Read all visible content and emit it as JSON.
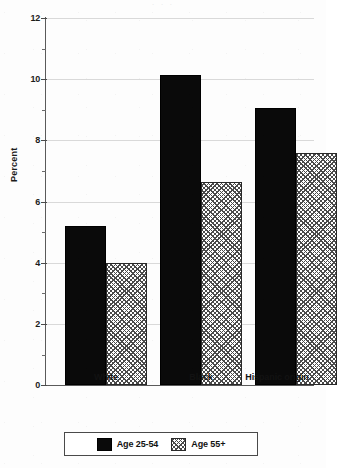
{
  "chart_data": {
    "type": "bar",
    "title": "",
    "subtitle": "",
    "xlabel": "",
    "ylabel": "Percent",
    "ylim": [
      0,
      12
    ],
    "ytick_labels": [
      "0",
      "2",
      "4",
      "6",
      "8",
      "10",
      "12"
    ],
    "ytick_values": [
      0,
      2,
      4,
      6,
      8,
      10,
      12
    ],
    "yminor_values": [
      1,
      3,
      5,
      7,
      9,
      11
    ],
    "grid": true,
    "grid_axis": "y",
    "legend_position": "bottom",
    "categories": [
      "White",
      "Black",
      "Hispanic origin"
    ],
    "series": [
      {
        "name": "Age 25-54",
        "pattern": "solid-black",
        "color": "#0a0a0a",
        "values": [
          5.2,
          10.15,
          9.05
        ]
      },
      {
        "name": "Age 55+",
        "pattern": "cross-hatch",
        "color": "#ffffff",
        "values": [
          4.0,
          6.65,
          7.6
        ]
      }
    ]
  },
  "axes": {
    "y_label": "Percent",
    "ticks": [
      {
        "label": "12",
        "value": 12
      },
      {
        "label": "10",
        "value": 10
      },
      {
        "label": "8",
        "value": 8
      },
      {
        "label": "6",
        "value": 6
      },
      {
        "label": "4",
        "value": 4
      },
      {
        "label": "2",
        "value": 2
      },
      {
        "label": "0",
        "value": 0
      }
    ],
    "categories": [
      {
        "label": "White"
      },
      {
        "label": "Black"
      },
      {
        "label": "Hispanic origin"
      }
    ]
  },
  "legend": {
    "entries": [
      {
        "label": "Age 25-54",
        "swatch": "solid-black-swatch"
      },
      {
        "label": "Age 55+",
        "swatch": "cross-hatch-swatch"
      }
    ]
  },
  "page": {
    "top_cropped_text": "·     ·        ·"
  }
}
